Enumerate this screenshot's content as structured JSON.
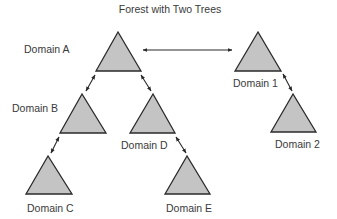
{
  "title": "Forest with Two Trees",
  "colors": {
    "triangle_fill": "#c4c4c4",
    "stroke": "#2a2a2a",
    "text": "#3a3a3a",
    "background": "#ffffff"
  },
  "nodes": [
    {
      "id": "A",
      "label": "Domain A",
      "tree": 1
    },
    {
      "id": "B",
      "label": "Domain B",
      "tree": 1
    },
    {
      "id": "C",
      "label": "Domain C",
      "tree": 1
    },
    {
      "id": "D",
      "label": "Domain D",
      "tree": 1
    },
    {
      "id": "E",
      "label": "Domain E",
      "tree": 1
    },
    {
      "id": "1",
      "label": "Domain 1",
      "tree": 2
    },
    {
      "id": "2",
      "label": "Domain 2",
      "tree": 2
    }
  ],
  "edges": [
    {
      "from": "A",
      "to": "1",
      "type": "bidirectional"
    },
    {
      "from": "A",
      "to": "B",
      "type": "bidirectional"
    },
    {
      "from": "A",
      "to": "D",
      "type": "bidirectional"
    },
    {
      "from": "B",
      "to": "C",
      "type": "bidirectional"
    },
    {
      "from": "D",
      "to": "E",
      "type": "bidirectional"
    },
    {
      "from": "1",
      "to": "2",
      "type": "bidirectional"
    }
  ]
}
